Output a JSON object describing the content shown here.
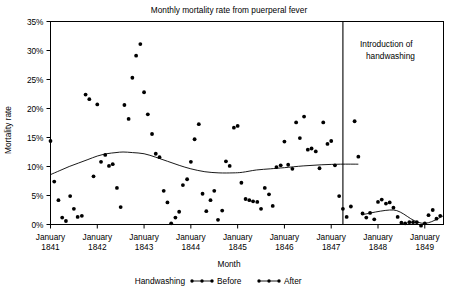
{
  "chart_data": {
    "type": "scatter",
    "title": "Monthly mortality rate from puerperal fever",
    "xlabel": "Month",
    "ylabel": "Mortality rate",
    "ylim": [
      0,
      35
    ],
    "ytick_labels": [
      "0%",
      "5%",
      "10%",
      "15%",
      "20%",
      "25%",
      "30%",
      "35%"
    ],
    "ytick_values": [
      0,
      5,
      10,
      15,
      20,
      25,
      30,
      35
    ],
    "xtick_labels": [
      "January\n1841",
      "January\n1842",
      "January\n1843",
      "January\n1844",
      "January\n1845",
      "January\n1846",
      "January\n1847",
      "January\n1848",
      "January\n1849"
    ],
    "xtick_years": [
      1841,
      1842,
      1843,
      1844,
      1845,
      1846,
      1847,
      1848,
      1849
    ],
    "xtick_month_label": "January",
    "xlim": [
      1841.0,
      1849.4
    ],
    "grid": false,
    "annotation": {
      "text_line1": "Introduction of",
      "text_line2": "handwashing",
      "x_value": 1847.25
    },
    "legend": {
      "position": "below-axis",
      "title": "Handwashing",
      "entries": [
        {
          "label": "Before",
          "marker": "dot-line-dot",
          "color": "#000000"
        },
        {
          "label": "After",
          "marker": "dot-line-dot",
          "color": "#000000"
        }
      ]
    },
    "series": [
      {
        "name": "Before",
        "color": "#000000",
        "points": [
          [
            1841.0,
            14.4
          ],
          [
            1841.08,
            7.4
          ],
          [
            1841.17,
            4.2
          ],
          [
            1841.25,
            1.2
          ],
          [
            1841.33,
            0.6
          ],
          [
            1841.42,
            4.9
          ],
          [
            1841.5,
            2.7
          ],
          [
            1841.58,
            1.3
          ],
          [
            1841.67,
            1.5
          ],
          [
            1841.75,
            22.4
          ],
          [
            1841.83,
            21.6
          ],
          [
            1841.92,
            8.3
          ],
          [
            1842.0,
            20.7
          ],
          [
            1842.08,
            10.8
          ],
          [
            1842.17,
            12.0
          ],
          [
            1842.25,
            10.1
          ],
          [
            1842.33,
            10.4
          ],
          [
            1842.42,
            6.3
          ],
          [
            1842.5,
            3.0
          ],
          [
            1842.58,
            20.6
          ],
          [
            1842.67,
            18.2
          ],
          [
            1842.75,
            25.3
          ],
          [
            1842.83,
            29.1
          ],
          [
            1842.92,
            31.1
          ],
          [
            1843.0,
            22.8
          ],
          [
            1843.08,
            19.0
          ],
          [
            1843.17,
            15.6
          ],
          [
            1843.25,
            12.2
          ],
          [
            1843.33,
            11.6
          ],
          [
            1843.42,
            5.8
          ],
          [
            1843.5,
            3.8
          ],
          [
            1843.58,
            0.2
          ],
          [
            1843.67,
            1.2
          ],
          [
            1843.75,
            2.2
          ],
          [
            1843.83,
            6.8
          ],
          [
            1843.92,
            7.8
          ],
          [
            1844.0,
            10.8
          ],
          [
            1844.08,
            14.7
          ],
          [
            1844.17,
            17.3
          ],
          [
            1844.25,
            5.3
          ],
          [
            1844.33,
            2.3
          ],
          [
            1844.42,
            4.2
          ],
          [
            1844.5,
            5.8
          ],
          [
            1844.58,
            0.8
          ],
          [
            1844.67,
            2.4
          ],
          [
            1844.75,
            10.9
          ],
          [
            1844.83,
            10.1
          ],
          [
            1844.92,
            16.7
          ],
          [
            1845.0,
            17.0
          ],
          [
            1845.08,
            7.2
          ],
          [
            1845.17,
            4.4
          ],
          [
            1845.25,
            4.2
          ],
          [
            1845.33,
            4.0
          ],
          [
            1845.42,
            3.9
          ],
          [
            1845.5,
            2.7
          ],
          [
            1845.58,
            6.3
          ],
          [
            1845.67,
            5.2
          ],
          [
            1845.75,
            3.2
          ],
          [
            1845.83,
            9.9
          ],
          [
            1845.92,
            10.2
          ],
          [
            1846.0,
            14.3
          ],
          [
            1846.08,
            10.3
          ],
          [
            1846.17,
            9.6
          ],
          [
            1846.25,
            17.6
          ],
          [
            1846.33,
            14.9
          ],
          [
            1846.42,
            18.6
          ],
          [
            1846.5,
            12.9
          ],
          [
            1846.58,
            13.1
          ],
          [
            1846.67,
            12.6
          ],
          [
            1846.75,
            9.7
          ],
          [
            1846.83,
            17.6
          ],
          [
            1846.92,
            13.9
          ],
          [
            1847.0,
            14.4
          ],
          [
            1847.08,
            10.2
          ],
          [
            1847.17,
            4.9
          ],
          [
            1847.25,
            2.7
          ],
          [
            1847.33,
            1.3
          ],
          [
            1847.42,
            3.1
          ],
          [
            1847.5,
            17.8
          ],
          [
            1847.58,
            11.7
          ]
        ]
      },
      {
        "name": "After",
        "color": "#000000",
        "points": [
          [
            1847.67,
            1.9
          ],
          [
            1847.75,
            1.2
          ],
          [
            1847.83,
            2.0
          ],
          [
            1847.92,
            0.9
          ],
          [
            1848.0,
            3.9
          ],
          [
            1848.08,
            4.3
          ],
          [
            1848.17,
            3.6
          ],
          [
            1848.25,
            3.8
          ],
          [
            1848.33,
            2.9
          ],
          [
            1848.42,
            1.3
          ],
          [
            1848.5,
            0.3
          ],
          [
            1848.58,
            0.2
          ],
          [
            1848.67,
            0.4
          ],
          [
            1848.75,
            0.4
          ],
          [
            1848.83,
            0.4
          ],
          [
            1848.92,
            -0.2
          ],
          [
            1849.0,
            0.2
          ],
          [
            1849.08,
            1.6
          ],
          [
            1849.17,
            2.5
          ],
          [
            1849.25,
            1.0
          ],
          [
            1849.33,
            1.5
          ]
        ]
      }
    ],
    "trend_before": [
      [
        1841.0,
        8.6
      ],
      [
        1841.2,
        9.3
      ],
      [
        1841.4,
        10.0
      ],
      [
        1841.6,
        10.6
      ],
      [
        1841.8,
        11.2
      ],
      [
        1842.0,
        11.8
      ],
      [
        1842.2,
        12.2
      ],
      [
        1842.4,
        12.4
      ],
      [
        1842.55,
        12.5
      ],
      [
        1842.75,
        12.4
      ],
      [
        1843.0,
        12.2
      ],
      [
        1843.25,
        11.6
      ],
      [
        1843.5,
        10.9
      ],
      [
        1843.75,
        10.2
      ],
      [
        1844.0,
        9.6
      ],
      [
        1844.3,
        9.1
      ],
      [
        1844.6,
        8.9
      ],
      [
        1844.9,
        8.9
      ],
      [
        1845.1,
        9.0
      ],
      [
        1845.4,
        9.4
      ],
      [
        1845.7,
        9.6
      ],
      [
        1846.0,
        9.8
      ],
      [
        1846.4,
        10.1
      ],
      [
        1846.8,
        10.3
      ],
      [
        1847.2,
        10.4
      ],
      [
        1847.58,
        10.4
      ]
    ],
    "trend_after": [
      [
        1847.67,
        1.7
      ],
      [
        1847.85,
        2.0
      ],
      [
        1848.05,
        2.3
      ],
      [
        1848.25,
        2.5
      ],
      [
        1848.4,
        2.4
      ],
      [
        1848.55,
        1.8
      ],
      [
        1848.7,
        1.0
      ],
      [
        1848.85,
        0.4
      ],
      [
        1849.0,
        0.2
      ],
      [
        1849.15,
        0.5
      ],
      [
        1849.3,
        1.1
      ],
      [
        1849.4,
        1.5
      ]
    ]
  }
}
